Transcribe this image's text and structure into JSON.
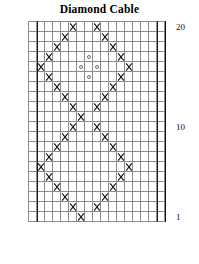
{
  "title": "Diamond Cable",
  "chart_data": {
    "type": "table",
    "title": "Diamond Cable",
    "subtitle": "",
    "xlabel": "",
    "ylabel": "",
    "grid": true,
    "legend_position": "none",
    "columns": 17,
    "rows": 20,
    "row_axis_labels": [
      {
        "row": 20,
        "label": "20"
      },
      {
        "row": 10,
        "label": "10"
      },
      {
        "row": 1,
        "label": "1"
      }
    ],
    "panel_dividers": [
      1,
      16
    ],
    "symbols": {
      "cross": "cable-cross",
      "circle": "open-circle"
    },
    "cells": [
      {
        "row": 20,
        "col": 6,
        "symbol": "cross"
      },
      {
        "row": 20,
        "col": 9,
        "symbol": "cross"
      },
      {
        "row": 19,
        "col": 5,
        "symbol": "cross"
      },
      {
        "row": 19,
        "col": 10,
        "symbol": "cross"
      },
      {
        "row": 18,
        "col": 4,
        "symbol": "cross"
      },
      {
        "row": 18,
        "col": 11,
        "symbol": "cross"
      },
      {
        "row": 17,
        "col": 3,
        "symbol": "cross"
      },
      {
        "row": 17,
        "col": 8,
        "symbol": "circle"
      },
      {
        "row": 17,
        "col": 12,
        "symbol": "cross"
      },
      {
        "row": 16,
        "col": 2,
        "symbol": "cross"
      },
      {
        "row": 16,
        "col": 7,
        "symbol": "circle"
      },
      {
        "row": 16,
        "col": 9,
        "symbol": "circle"
      },
      {
        "row": 16,
        "col": 13,
        "symbol": "cross"
      },
      {
        "row": 15,
        "col": 3,
        "symbol": "cross"
      },
      {
        "row": 15,
        "col": 8,
        "symbol": "circle"
      },
      {
        "row": 15,
        "col": 12,
        "symbol": "cross"
      },
      {
        "row": 14,
        "col": 4,
        "symbol": "cross"
      },
      {
        "row": 14,
        "col": 11,
        "symbol": "cross"
      },
      {
        "row": 13,
        "col": 5,
        "symbol": "cross"
      },
      {
        "row": 13,
        "col": 10,
        "symbol": "cross"
      },
      {
        "row": 12,
        "col": 6,
        "symbol": "cross"
      },
      {
        "row": 12,
        "col": 9,
        "symbol": "cross"
      },
      {
        "row": 11,
        "col": 7,
        "symbol": "cross"
      },
      {
        "row": 10,
        "col": 6,
        "symbol": "cross"
      },
      {
        "row": 10,
        "col": 9,
        "symbol": "cross"
      },
      {
        "row": 9,
        "col": 5,
        "symbol": "cross"
      },
      {
        "row": 9,
        "col": 10,
        "symbol": "cross"
      },
      {
        "row": 8,
        "col": 4,
        "symbol": "cross"
      },
      {
        "row": 8,
        "col": 11,
        "symbol": "cross"
      },
      {
        "row": 7,
        "col": 3,
        "symbol": "cross"
      },
      {
        "row": 7,
        "col": 12,
        "symbol": "cross"
      },
      {
        "row": 6,
        "col": 2,
        "symbol": "cross"
      },
      {
        "row": 6,
        "col": 13,
        "symbol": "cross"
      },
      {
        "row": 5,
        "col": 3,
        "symbol": "cross"
      },
      {
        "row": 5,
        "col": 12,
        "symbol": "cross"
      },
      {
        "row": 4,
        "col": 4,
        "symbol": "cross"
      },
      {
        "row": 4,
        "col": 11,
        "symbol": "cross"
      },
      {
        "row": 3,
        "col": 5,
        "symbol": "cross"
      },
      {
        "row": 3,
        "col": 10,
        "symbol": "cross"
      },
      {
        "row": 2,
        "col": 6,
        "symbol": "cross"
      },
      {
        "row": 2,
        "col": 9,
        "symbol": "cross"
      },
      {
        "row": 1,
        "col": 7,
        "symbol": "cross"
      }
    ]
  },
  "measurements": [
    {
      "label": "15 sts",
      "from_col": 2,
      "to_col": 16
    },
    {
      "label": "17 sts",
      "from_col": 1,
      "to_col": 18
    }
  ]
}
